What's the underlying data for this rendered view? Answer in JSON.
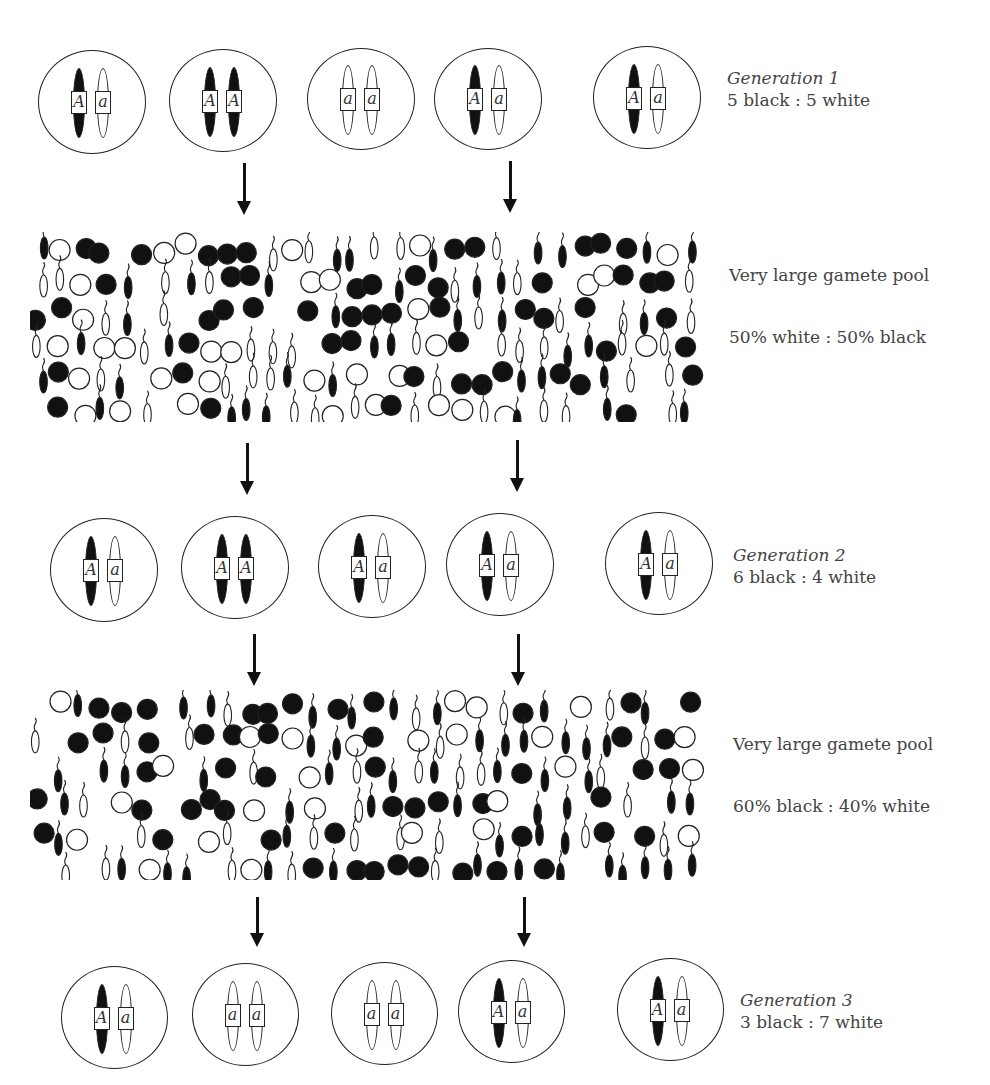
{
  "generations": [
    {
      "title": "Generation 1",
      "ratio": "5 black : 5 white",
      "cells": [
        {
          "alleles": [
            "A",
            "a"
          ]
        },
        {
          "alleles": [
            "A",
            "A"
          ]
        },
        {
          "alleles": [
            "a",
            "a"
          ]
        },
        {
          "alleles": [
            "A",
            "a"
          ]
        },
        {
          "alleles": [
            "A",
            "a"
          ]
        }
      ]
    },
    {
      "title": "Generation 2",
      "ratio": "6 black : 4 white",
      "cells": [
        {
          "alleles": [
            "A",
            "a"
          ]
        },
        {
          "alleles": [
            "A",
            "A"
          ]
        },
        {
          "alleles": [
            "A",
            "a"
          ]
        },
        {
          "alleles": [
            "A",
            "a"
          ]
        },
        {
          "alleles": [
            "A",
            "a"
          ]
        }
      ]
    },
    {
      "title": "Generation 3",
      "ratio": "3 black : 7 white",
      "cells": [
        {
          "alleles": [
            "A",
            "a"
          ]
        },
        {
          "alleles": [
            "a",
            "a"
          ]
        },
        {
          "alleles": [
            "a",
            "a"
          ]
        },
        {
          "alleles": [
            "A",
            "a"
          ]
        },
        {
          "alleles": [
            "A",
            "a"
          ]
        }
      ]
    }
  ],
  "gamete_pools": [
    {
      "label": "Very large gamete pool",
      "ratio": "50% white : 50% black",
      "black_fraction": 0.5,
      "legend": {
        "egg": "circle",
        "sperm": "tailed-oval",
        "black": "A allele",
        "white": "a allele"
      }
    },
    {
      "label": "Very large gamete pool",
      "ratio": "60% black : 40% white",
      "black_fraction": 0.6,
      "legend": {
        "egg": "circle",
        "sperm": "tailed-oval",
        "black": "A allele",
        "white": "a allele"
      }
    }
  ],
  "colors": {
    "black": "#111111",
    "white": "#ffffff",
    "stroke": "#222222",
    "text": "#444444"
  }
}
